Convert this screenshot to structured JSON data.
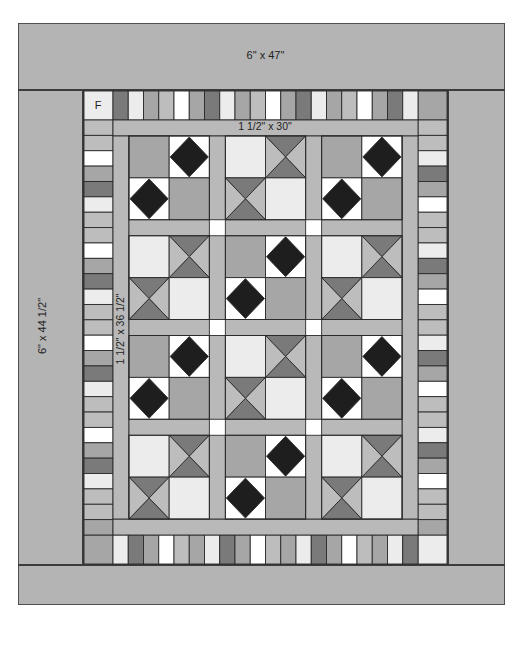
{
  "diagram": {
    "labels": {
      "top_border": "6\" x 47\"",
      "side_border": "6\" x 44 1/2\"",
      "inner_top_border": "1 1/2\" x 30\"",
      "inner_side_border": "1 1/2\" x 36 1/2\"",
      "corner_block": "F"
    },
    "colors": {
      "background": "#b4b4b4",
      "sashing": "#b9b9b9",
      "outline": "#2a2a2a",
      "white": "#ffffff",
      "light": "#ececec",
      "mid_light": "#bdbdbd",
      "mid": "#a6a6a6",
      "mid_dark": "#929292",
      "dark": "#7a7a7a",
      "diamond": "#1e1e1e",
      "cornerstone": "#ffffff"
    },
    "top_piano_strip": [
      "dark",
      "light",
      "mid",
      "mid_light",
      "white",
      "mid",
      "dark",
      "light",
      "mid",
      "mid_light",
      "white",
      "mid",
      "dark",
      "light",
      "mid",
      "mid_light",
      "white",
      "mid",
      "dark",
      "light"
    ],
    "bottom_piano_strip": [
      "light",
      "dark",
      "mid",
      "white",
      "mid_light",
      "mid",
      "light",
      "dark",
      "mid",
      "white",
      "mid_light",
      "mid",
      "light",
      "dark",
      "mid",
      "white",
      "mid_light",
      "mid",
      "light",
      "dark"
    ],
    "left_piano_strip": [
      "mid_light",
      "mid_light",
      "white",
      "mid",
      "dark",
      "light",
      "mid_light",
      "mid_light",
      "white",
      "mid",
      "dark",
      "light",
      "mid_light",
      "mid_light",
      "white",
      "mid",
      "dark",
      "light",
      "mid_light",
      "mid_light",
      "white",
      "mid",
      "dark",
      "light",
      "mid_light",
      "mid_light",
      "mid"
    ],
    "right_piano_strip": [
      "mid_light",
      "mid_light",
      "light",
      "dark",
      "mid",
      "white",
      "mid_light",
      "mid_light",
      "light",
      "dark",
      "mid",
      "white",
      "mid_light",
      "mid_light",
      "light",
      "dark",
      "mid",
      "white",
      "mid_light",
      "mid_light",
      "light",
      "dark",
      "mid",
      "white",
      "mid_light",
      "mid_light",
      "mid"
    ],
    "block_grid": {
      "rows": 4,
      "cols": 3,
      "pattern": [
        [
          "diamond",
          "hourglass",
          "diamond"
        ],
        [
          "hourglass",
          "diamond",
          "hourglass"
        ],
        [
          "diamond",
          "hourglass",
          "diamond"
        ],
        [
          "hourglass",
          "diamond",
          "hourglass"
        ]
      ]
    }
  }
}
